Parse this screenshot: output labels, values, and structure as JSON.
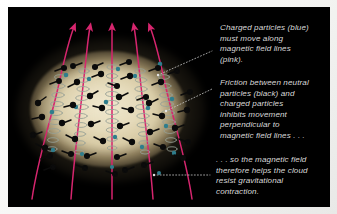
{
  "figure": {
    "frame_color": "#f2f2f0",
    "plate_color": "#000000"
  },
  "illustration": {
    "name": "magnetic-field-cloud-diagram",
    "cloud": {
      "label": "interstellar gas cloud",
      "color": "#e3d8b8"
    },
    "field_lines": {
      "label": "magnetic field lines",
      "color": "#d6256e",
      "count": 5,
      "arrow_direction": "up"
    },
    "helices": {
      "label": "charged particle spiral paths",
      "color": "#9aa39a",
      "count": 5
    },
    "neutral_particles": {
      "label": "neutral particles",
      "color": "#0b0b0b",
      "count": 46
    },
    "charged_particles": {
      "label": "charged particles",
      "color": "#2f7d8c",
      "count": 18
    },
    "leader_color": "#cfcfcf"
  },
  "captions": [
    {
      "id": "caption-1",
      "text": "Charged particles (blue)\nmust move along\nmagnetic field lines\n(pink)."
    },
    {
      "id": "caption-2",
      "text": "Friction between neutral\nparticles (black) and\ncharged particles\ninhibits movement\nperpendicular to\nmagnetic field lines . . ."
    },
    {
      "id": "caption-3",
      "text": ". . . so the magnetic field\ntherefore helps the cloud\nresist gravitational\ncontraction."
    }
  ]
}
